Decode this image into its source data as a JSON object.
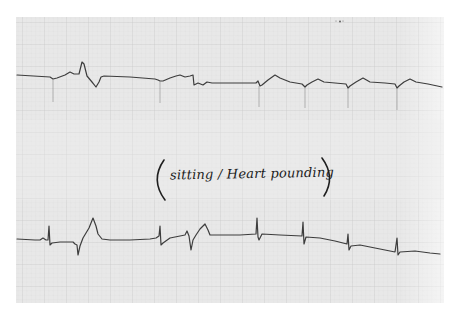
{
  "image": {
    "description": "Photograph of an ECG rhythm strip on grid paper with handwritten annotation",
    "background": "#ffffff",
    "paper": {
      "x": 16,
      "y": 17,
      "width": 428,
      "height": 286,
      "color": "#e9e9e9",
      "grid_fine": "#dcdcdc",
      "grid_major": "#cfcfcf",
      "fine_spacing": 4.4,
      "major_spacing": 22
    },
    "trace_color": "#3d3d3d"
  },
  "annotation": {
    "text": "(sitting / Heart pounding)",
    "open_paren": "(",
    "body": "sitting / Heart pounding",
    "close_paren": ")"
  },
  "marks": [
    {
      "name": "top-smudge",
      "x": 338,
      "y": 21
    }
  ],
  "traces": {
    "top": "17,75 50,77 53,79 57,78 65,75 70,72 74,74 79,74 82,62 84,64 87,76 92,82 96,87 99,82 101,77 104,76 130,77 155,79 158,80 160,81 163,81 170,78 176,76 180,75 185,77 190,76 193,75 194,85 198,83 203,85 207,82 212,83 230,83 256,83 258,81 260,86 262,85 268,80 275,75 280,78 290,82 302,84 305,87 307,85 312,82 318,79 324,82 335,83 346,84 348,88 350,86 356,82 363,78 370,82 385,83 395,84 397,88 399,86 404,82 410,79 416,82 428,84 442,87",
    "top_spikes": [
      {
        "x": 53,
        "y1": 79,
        "y2": 102
      },
      {
        "x": 160,
        "y1": 81,
        "y2": 103
      },
      {
        "x": 259,
        "y1": 86,
        "y2": 107
      },
      {
        "x": 305,
        "y1": 87,
        "y2": 108
      },
      {
        "x": 348,
        "y1": 88,
        "y2": 108
      },
      {
        "x": 397,
        "y1": 88,
        "y2": 110
      }
    ],
    "bottom": "17,239 35,240 40,240 43,238 46,240 48,240 49,226 50,245 52,243 60,242 73,242 75,244 77,245 78,255 80,246 83,238 86,233 89,228 93,218 96,226 98,234 102,239 110,240 130,240 150,239 156,238 159,236 160,226 161,245 163,243 170,238 180,236 185,235 187,231 189,236 191,250 193,240 196,235 200,229 205,224 208,230 210,235 220,235 240,235 256,234 257,218 258,237 259,240 262,234 280,235 302,236 303,222 304,244 306,237 320,238 335,241 347,244 348,234 349,250 351,246 360,245 375,248 395,252 397,238 398,255 400,252 415,251 430,253 440,254"
  }
}
